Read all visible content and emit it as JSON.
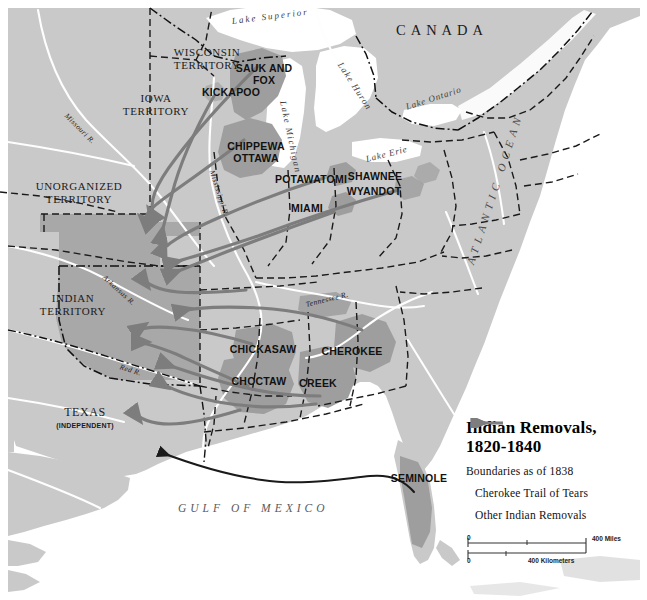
{
  "map": {
    "title_line1": "Indian Removals,",
    "title_line2": "1820-1840",
    "boundaries_note": "Boundaries as of 1838",
    "legend": {
      "cherokee_label": "Cherokee Trail of Tears",
      "other_label": "Other Indian Removals",
      "cherokee_color": "#1a1a1a",
      "other_color": "#7d7d7d"
    },
    "scale": {
      "miles_zero": "0",
      "miles_max": "400 Miles",
      "km_zero": "0",
      "km_max": "400 Kilometers"
    },
    "colors": {
      "land": "#c9c9c9",
      "water": "#ffffff",
      "tribal_fill": "#9e9e9e",
      "territory_fill": "#a8a8a8",
      "border": "#1a1a1a"
    },
    "countries": [
      {
        "name": "CANADA",
        "x": 396,
        "y": 30
      }
    ],
    "oceans": [
      {
        "name": "ATLANTIC OCEAN",
        "x": 498,
        "y": 268,
        "rotate": -72
      },
      {
        "name": "GULF OF MEXICO",
        "x": 178,
        "y": 508
      }
    ],
    "lakes": [
      {
        "name": "Lake Superior",
        "x": 232,
        "y": 20,
        "rotate": -8
      },
      {
        "name": "Lake Michigan",
        "x": 286,
        "y": 98,
        "rotate": 78
      },
      {
        "name": "Lake Huron",
        "x": 344,
        "y": 60,
        "rotate": 58
      },
      {
        "name": "Lake Ontario",
        "x": 418,
        "y": 104,
        "rotate": -16
      },
      {
        "name": "Lake Erie",
        "x": 374,
        "y": 156,
        "rotate": -16
      }
    ],
    "rivers": [
      {
        "name": "Missouri R.",
        "x": 68,
        "y": 112,
        "rotate": 46
      },
      {
        "name": "Mississippi R.",
        "x": 214,
        "y": 172,
        "rotate": 72
      },
      {
        "name": "Arkansas R.",
        "x": 88,
        "y": 272,
        "rotate": 40
      },
      {
        "name": "Red R.",
        "x": 122,
        "y": 364,
        "rotate": 20
      },
      {
        "name": "Tennessee R.",
        "x": 332,
        "y": 296,
        "rotate": -12
      }
    ],
    "territories": [
      {
        "name": "WISCONSIN\nTERRITORY",
        "x": 206,
        "y": 52
      },
      {
        "name": "IOWA\nTERRITORY",
        "x": 155,
        "y": 98
      },
      {
        "name": "UNORGANIZED\nTERRITORY",
        "x": 77,
        "y": 186
      },
      {
        "name": "INDIAN\nTERRITORY",
        "x": 73,
        "y": 298
      },
      {
        "name": "TEXAS",
        "x": 80,
        "y": 413
      }
    ],
    "texas_sub": "(INDEPENDENT)",
    "tribes": [
      {
        "name": "SAUK AND\nFOX",
        "x": 264,
        "y": 68
      },
      {
        "name": "KICKAPOO",
        "x": 231,
        "y": 92
      },
      {
        "name": "CHIPPEWA\nOTTAWA",
        "x": 256,
        "y": 146
      },
      {
        "name": "POTAWATOMI",
        "x": 311,
        "y": 179
      },
      {
        "name": "MIAMI",
        "x": 307,
        "y": 208
      },
      {
        "name": "SHAWNEE",
        "x": 375,
        "y": 176
      },
      {
        "name": "WYANDOT",
        "x": 374,
        "y": 191
      },
      {
        "name": "CHICKASAW",
        "x": 262,
        "y": 349
      },
      {
        "name": "CHEROKEE",
        "x": 351,
        "y": 351
      },
      {
        "name": "CHOCTAW",
        "x": 257,
        "y": 381
      },
      {
        "name": "CREEK",
        "x": 317,
        "y": 383
      },
      {
        "name": "SEMINOLE",
        "x": 416,
        "y": 478
      }
    ]
  }
}
